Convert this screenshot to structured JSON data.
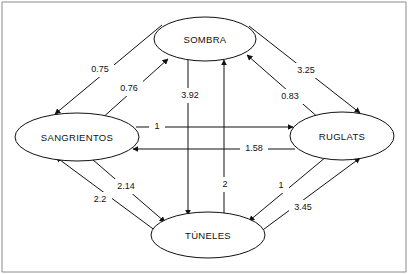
{
  "diagram": {
    "type": "directed-weighted-graph",
    "title": "",
    "background_color": "#ffffff",
    "stroke_color": "#111111",
    "frame_color": "#8a8a8a",
    "nodes": [
      {
        "id": "sombra",
        "label": "SOMBRA",
        "cx": 205,
        "cy": 39,
        "rx": 51,
        "ry": 22
      },
      {
        "id": "sangrientos",
        "label": "SANGRIENTOS",
        "cx": 77,
        "cy": 137,
        "rx": 62,
        "ry": 24
      },
      {
        "id": "ruglats",
        "label": "RUGLATS",
        "cx": 342,
        "cy": 136,
        "rx": 52,
        "ry": 24
      },
      {
        "id": "tuneles",
        "label": "TÚNELES",
        "cx": 208,
        "cy": 235,
        "rx": 57,
        "ry": 23
      }
    ],
    "edges": [
      {
        "id": "e1",
        "from": "sombra",
        "to": "sangrientos",
        "weight": "0.75",
        "lx": 100,
        "ly": 70
      },
      {
        "id": "e2",
        "from": "sangrientos",
        "to": "sombra",
        "weight": "0.76",
        "lx": 129,
        "ly": 89
      },
      {
        "id": "e3",
        "from": "sombra",
        "to": "ruglats",
        "weight": "3.25",
        "lx": 306,
        "ly": 71
      },
      {
        "id": "e4",
        "from": "ruglats",
        "to": "sombra",
        "weight": "0.83",
        "lx": 290,
        "ly": 97
      },
      {
        "id": "e5",
        "from": "sombra",
        "to": "tuneles",
        "weight": "3.92",
        "lx": 190,
        "ly": 96
      },
      {
        "id": "e6",
        "from": "tuneles",
        "to": "sombra",
        "weight": "2",
        "lx": 225,
        "ly": 185
      },
      {
        "id": "e7",
        "from": "sangrientos",
        "to": "ruglats",
        "weight": "1",
        "lx": 157,
        "ly": 127
      },
      {
        "id": "e8",
        "from": "ruglats",
        "to": "sangrientos",
        "weight": "1.58",
        "lx": 254,
        "ly": 149
      },
      {
        "id": "e9",
        "from": "sangrientos",
        "to": "tuneles",
        "weight": "2.14",
        "lx": 126,
        "ly": 187
      },
      {
        "id": "e10",
        "from": "tuneles",
        "to": "sangrientos",
        "weight": "2.2",
        "lx": 100,
        "ly": 200
      },
      {
        "id": "e11",
        "from": "ruglats",
        "to": "tuneles",
        "weight": "1",
        "lx": 281,
        "ly": 186
      },
      {
        "id": "e12",
        "from": "tuneles",
        "to": "ruglats",
        "weight": "3.45",
        "lx": 303,
        "ly": 208
      }
    ]
  }
}
